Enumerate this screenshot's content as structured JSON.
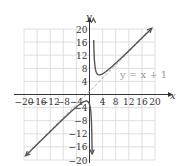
{
  "chart_data": {
    "type": "line",
    "title": "",
    "xlabel": "x",
    "ylabel": "y",
    "xlim": [
      -20,
      20
    ],
    "ylim": [
      -20,
      20
    ],
    "grid": true,
    "grid_step": 4,
    "x_ticks": [
      "-20",
      "-16",
      "-12",
      "-8",
      "-4",
      "4",
      "8",
      "12",
      "16",
      "20"
    ],
    "y_ticks": [
      "20",
      "16",
      "12",
      "8",
      "4",
      "-4",
      "-8",
      "-12",
      "-16",
      "-20"
    ],
    "series": [
      {
        "name": "f(x)",
        "description": "rational function with vertical asymptote x = 1 and oblique asymptote y = x + 1",
        "points_right_branch": [
          [
            1.2,
            20
          ],
          [
            1.5,
            10.5
          ],
          [
            2,
            7
          ],
          [
            3,
            6
          ],
          [
            4,
            6.3
          ],
          [
            6,
            7.8
          ],
          [
            10,
            11.4
          ],
          [
            14,
            15.3
          ],
          [
            19,
            20
          ]
        ],
        "points_left_branch": [
          [
            -20,
            -19.2
          ],
          [
            -16,
            -15.2
          ],
          [
            -12,
            -11.3
          ],
          [
            -8,
            -7.4
          ],
          [
            -4,
            -3.8
          ],
          [
            -1,
            -2
          ],
          [
            0,
            -3
          ],
          [
            0.5,
            -7.5
          ],
          [
            0.8,
            -20
          ]
        ]
      },
      {
        "name": "asymptote",
        "label": "y = x + 1",
        "style": "dashed",
        "points": [
          [
            -20,
            -19
          ],
          [
            20,
            21
          ]
        ]
      }
    ],
    "annotations": [
      "y = x + 1"
    ]
  },
  "labels": {
    "x_axis": "x",
    "y_axis": "y",
    "asymptote": "y = x + 1"
  },
  "colors": {
    "curve": "#555555",
    "asymptote": "#aaaaaa",
    "grid": "#d8d8d8",
    "axis": "#333333"
  }
}
